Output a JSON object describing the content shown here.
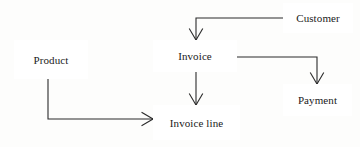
{
  "diagram": {
    "type": "entity-relationship-diagram",
    "notation": "crows-foot",
    "width": 360,
    "height": 147,
    "background_color": "#fdfdfc",
    "line_color": "#2b2b2b",
    "box_fill_color": "#ffffff",
    "box_border_color": "#2b2b2b",
    "text_color": "#1a1a1a",
    "entities": [
      {
        "id": "product",
        "label": "Product",
        "x": 14,
        "y": 40,
        "width": 74,
        "height": 39,
        "font_size": 11
      },
      {
        "id": "invoice",
        "label": "Invoice",
        "x": 153,
        "y": 40,
        "width": 84,
        "height": 32,
        "font_size": 11
      },
      {
        "id": "invoice_line",
        "label": "Invoice line",
        "x": 153,
        "y": 105,
        "width": 87,
        "height": 35,
        "font_size": 11
      },
      {
        "id": "customer",
        "label": "Customer",
        "x": 283,
        "y": 3,
        "width": 70,
        "height": 30,
        "font_size": 11
      },
      {
        "id": "payment",
        "label": "Payment",
        "x": 283,
        "y": 84,
        "width": 69,
        "height": 32,
        "font_size": 11
      }
    ],
    "relationships": [
      {
        "id": "customer-invoice",
        "from": "customer",
        "to": "invoice",
        "from_cardinality": "one",
        "to_cardinality": "many",
        "path": "M 283 18 L 196 18 L 196 40",
        "crowsfoot_at": {
          "x": 196,
          "y": 40,
          "direction": "down"
        }
      },
      {
        "id": "invoice-payment",
        "from": "invoice",
        "to": "payment",
        "from_cardinality": "one",
        "to_cardinality": "many",
        "path": "M 237 57 L 317 57 L 317 84",
        "crowsfoot_at": {
          "x": 317,
          "y": 84,
          "direction": "down"
        }
      },
      {
        "id": "invoice-invoiceline",
        "from": "invoice",
        "to": "invoice_line",
        "from_cardinality": "one",
        "to_cardinality": "many",
        "path": "M 196 72 L 196 105",
        "crowsfoot_at": {
          "x": 196,
          "y": 105,
          "direction": "down"
        }
      },
      {
        "id": "product-invoiceline",
        "from": "product",
        "to": "invoice_line",
        "from_cardinality": "one",
        "to_cardinality": "many",
        "path": "M 48 79 L 48 119 L 153 119",
        "crowsfoot_at": {
          "x": 153,
          "y": 119,
          "direction": "left"
        }
      }
    ]
  }
}
